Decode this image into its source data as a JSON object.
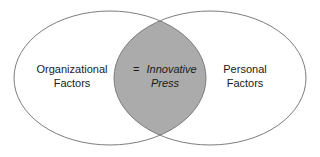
{
  "figure": {
    "type": "venn-diagram",
    "width": 320,
    "height": 157,
    "background_color": "#ffffff"
  },
  "style": {
    "ellipse_stroke_color": "#7d7d7d",
    "ellipse_stroke_width": 1,
    "ellipse_fill_color": "#ffffff",
    "intersection_fill_color": "#ababab",
    "text_color": "#1a1a1a",
    "font_size": 11
  },
  "sets": {
    "left": {
      "name": "organizational-factors",
      "label_line1": "Organizational",
      "label_line2": "Factors",
      "center_x": 110,
      "center_y": 78,
      "radius_x": 96,
      "radius_y": 67,
      "label_x": 72,
      "label_y_line1": 70,
      "label_y_line2": 84
    },
    "right": {
      "name": "personal-factors",
      "label_line1": "Personal",
      "label_line2": "Factors",
      "center_x": 210,
      "center_y": 78,
      "radius_x": 96,
      "radius_y": 67,
      "label_x": 245,
      "label_y_line1": 70,
      "label_y_line2": 84
    },
    "intersection": {
      "name": "innovative-press",
      "label_line1_prefix": "=",
      "label_line1": "Innovative",
      "label_line2": "Press",
      "label_x": 160,
      "label_y_line1": 70,
      "label_y_line2": 84
    }
  }
}
